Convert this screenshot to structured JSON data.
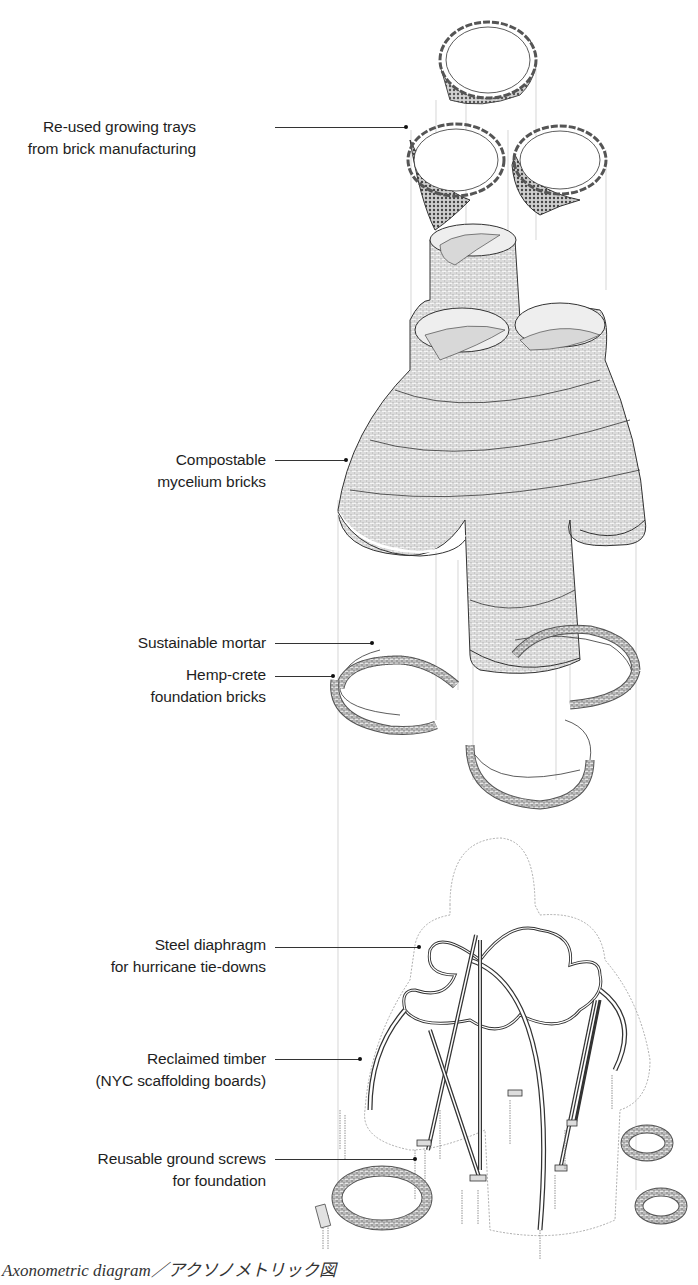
{
  "diagram": {
    "type": "exploded axonometric",
    "layers_top_to_bottom": [
      "growing trays",
      "mycelium brick tower",
      "mortar and hemp-crete foundation rings",
      "steel diaphragm and timber frame",
      "ground screws"
    ]
  },
  "labels": [
    {
      "id": "trays",
      "lines": [
        "Re-used growing trays",
        "from brick manufacturing"
      ]
    },
    {
      "id": "mycelium",
      "lines": [
        "Compostable",
        "mycelium bricks"
      ]
    },
    {
      "id": "mortar",
      "lines": [
        "Sustainable mortar"
      ]
    },
    {
      "id": "hempcrete",
      "lines": [
        "Hemp-crete",
        "foundation bricks"
      ]
    },
    {
      "id": "diaphragm",
      "lines": [
        "Steel diaphragm",
        "for hurricane tie-downs"
      ]
    },
    {
      "id": "timber",
      "lines": [
        "Reclaimed timber",
        "(NYC scaffolding boards)"
      ]
    },
    {
      "id": "screws",
      "lines": [
        "Reusable ground screws",
        "for foundation"
      ]
    }
  ],
  "caption": "Axonometric diagram／アクソノメトリック図",
  "colors": {
    "background": "#ffffff",
    "ink": "#222222",
    "hatch": "#777777",
    "projection_lines": "#bbbbbb"
  }
}
